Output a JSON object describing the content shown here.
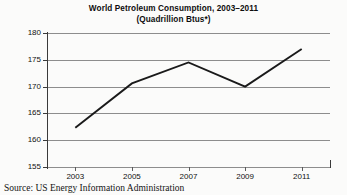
{
  "figure": {
    "title_line1": "World Petroleum Consumption, 2003–2011",
    "title_line2": "(Quadrillion Btus*)",
    "source_note": "Source: US Energy Information Administration",
    "line_color": "#1a1a1a",
    "grid_color": "#8d8d8d",
    "axis_color": "#3a3a3a",
    "background_color": "#fbfbfa"
  },
  "chart_data": {
    "type": "line",
    "title": "World Petroleum Consumption, 2003–2011 (Quadrillion Btus*)",
    "xlabel": "",
    "ylabel": "Btus",
    "x": [
      2003,
      2005,
      2007,
      2009,
      2011
    ],
    "categories": [
      "2003",
      "2005",
      "2007",
      "2009",
      "2011"
    ],
    "values": [
      162.3,
      170.6,
      174.5,
      170.0,
      177.0
    ],
    "series": [
      {
        "name": "World Petroleum Consumption",
        "values": [
          162.3,
          170.6,
          174.5,
          170.0,
          177.0
        ]
      }
    ],
    "xlim": [
      2002,
      2012
    ],
    "ylim": [
      155,
      180
    ],
    "yticks": [
      155,
      160,
      165,
      170,
      175,
      180
    ],
    "ytick_labels": [
      "155",
      "160",
      "165",
      "170",
      "175",
      "180"
    ],
    "xticks": [
      2003,
      2005,
      2007,
      2009,
      2011
    ],
    "xtick_labels": [
      "2003",
      "2005",
      "2007",
      "2009",
      "2011"
    ],
    "grid": "horizontal",
    "legend": "none",
    "markers": "none"
  }
}
